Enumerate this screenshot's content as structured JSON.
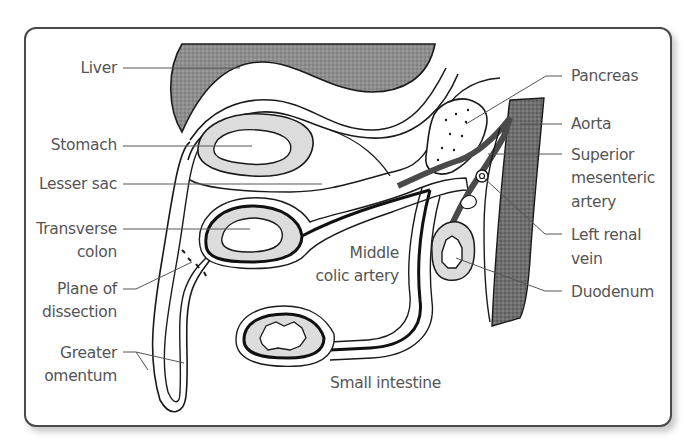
{
  "figure": {
    "colors": {
      "frame_border": "#4a4a4a",
      "label_text": "#555555",
      "liver_fill": "#8e8e8e",
      "aorta_fill": "#6e6e6e",
      "mucosa_fill": "#dcdcdc",
      "outline": "#1a1a1a"
    }
  },
  "labels_left": {
    "liver": "Liver",
    "stomach": "Stomach",
    "lesser_sac": "Lesser sac",
    "transverse_colon_1": "Transverse",
    "transverse_colon_2": "colon",
    "plane_1": "Plane of",
    "plane_2": "dissection",
    "greater_omentum_1": "Greater",
    "greater_omentum_2": "omentum"
  },
  "labels_right": {
    "pancreas": "Pancreas",
    "aorta": "Aorta",
    "sma_1": "Superior",
    "sma_2": "mesenteric",
    "sma_3": "artery",
    "lrv_1": "Left renal",
    "lrv_2": "vein",
    "duodenum": "Duodenum"
  },
  "labels_center": {
    "mca_1": "Middle",
    "mca_2": "colic artery",
    "small_intestine": "Small intestine"
  }
}
